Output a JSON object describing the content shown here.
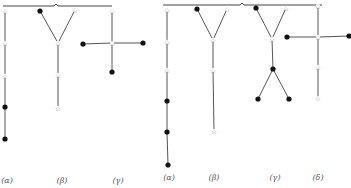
{
  "figure": {
    "groups": [
      {
        "id": "left",
        "bracket": {
          "x1": 3,
          "x2": 112,
          "y": 5,
          "mid": 56
        },
        "trees": [
          {
            "label": "(α)",
            "label_x": 7,
            "label_y": 183,
            "nodes": [
              {
                "x": 5,
                "y": 11,
                "type": "star"
              },
              {
                "x": 5,
                "y": 43,
                "type": "star"
              },
              {
                "x": 5,
                "y": 76,
                "type": "star"
              },
              {
                "x": 5,
                "y": 107,
                "type": "dot"
              },
              {
                "x": 5,
                "y": 139,
                "type": "dot"
              }
            ],
            "edges": [
              [
                0,
                1
              ],
              [
                1,
                2
              ],
              [
                2,
                3
              ],
              [
                3,
                4
              ]
            ]
          },
          {
            "label": "(β)",
            "label_x": 62,
            "label_y": 183,
            "nodes": [
              {
                "x": 40,
                "y": 11,
                "type": "dot"
              },
              {
                "x": 75,
                "y": 10,
                "type": "star"
              },
              {
                "x": 58,
                "y": 43,
                "type": "star"
              },
              {
                "x": 58,
                "y": 75,
                "type": "star"
              },
              {
                "x": 58,
                "y": 108,
                "type": "star"
              }
            ],
            "edges": [
              [
                0,
                2
              ],
              [
                1,
                2
              ],
              [
                2,
                3
              ],
              [
                3,
                4
              ]
            ]
          },
          {
            "label": "(γ)",
            "label_x": 118,
            "label_y": 183,
            "nodes": [
              {
                "x": 112,
                "y": 11,
                "type": "star"
              },
              {
                "x": 112,
                "y": 43,
                "type": "star"
              },
              {
                "x": 83,
                "y": 44,
                "type": "dot"
              },
              {
                "x": 143,
                "y": 43,
                "type": "dot"
              },
              {
                "x": 112,
                "y": 72,
                "type": "dot"
              }
            ],
            "edges": [
              [
                0,
                1
              ],
              [
                2,
                1
              ],
              [
                1,
                3
              ],
              [
                1,
                4
              ]
            ]
          }
        ]
      },
      {
        "id": "right",
        "bracket": {
          "x1": 163,
          "x2": 322,
          "y": 4,
          "mid": 242
        },
        "trees": [
          {
            "label": "(α)",
            "label_x": 169,
            "label_y": 180,
            "nodes": [
              {
                "x": 167,
                "y": 10,
                "type": "star"
              },
              {
                "x": 167,
                "y": 42,
                "type": "star"
              },
              {
                "x": 167,
                "y": 70,
                "type": "star"
              },
              {
                "x": 167,
                "y": 101,
                "type": "dot"
              },
              {
                "x": 167,
                "y": 132,
                "type": "dot"
              },
              {
                "x": 168,
                "y": 165,
                "type": "dot"
              }
            ],
            "edges": [
              [
                0,
                1
              ],
              [
                1,
                2
              ],
              [
                2,
                3
              ],
              [
                3,
                4
              ],
              [
                4,
                5
              ]
            ]
          },
          {
            "label": "(β)",
            "label_x": 214,
            "label_y": 180,
            "nodes": [
              {
                "x": 197,
                "y": 9,
                "type": "dot"
              },
              {
                "x": 227,
                "y": 9,
                "type": "star"
              },
              {
                "x": 213,
                "y": 40,
                "type": "star"
              },
              {
                "x": 213,
                "y": 70,
                "type": "star"
              },
              {
                "x": 214,
                "y": 131,
                "type": "star"
              }
            ],
            "edges": [
              [
                0,
                2
              ],
              [
                1,
                2
              ],
              [
                2,
                3
              ],
              [
                3,
                4
              ]
            ]
          },
          {
            "label": "(γ)",
            "label_x": 275,
            "label_y": 180,
            "nodes": [
              {
                "x": 256,
                "y": 8,
                "type": "dot"
              },
              {
                "x": 286,
                "y": 8,
                "type": "star"
              },
              {
                "x": 272,
                "y": 39,
                "type": "star"
              },
              {
                "x": 273,
                "y": 69,
                "type": "dot"
              },
              {
                "x": 258,
                "y": 99,
                "type": "dot"
              },
              {
                "x": 289,
                "y": 99,
                "type": "dot"
              }
            ],
            "edges": [
              [
                0,
                2
              ],
              [
                1,
                2
              ],
              [
                2,
                3
              ],
              [
                3,
                4
              ],
              [
                3,
                5
              ]
            ]
          },
          {
            "label": "(δ)",
            "label_x": 318,
            "label_y": 180,
            "nodes": [
              {
                "x": 318,
                "y": 6,
                "type": "star"
              },
              {
                "x": 318,
                "y": 37,
                "type": "star"
              },
              {
                "x": 287,
                "y": 37,
                "type": "dot"
              },
              {
                "x": 349,
                "y": 36,
                "type": "dot"
              },
              {
                "x": 318,
                "y": 67,
                "type": "star"
              },
              {
                "x": 318,
                "y": 98,
                "type": "star"
              }
            ],
            "edges": [
              [
                0,
                1
              ],
              [
                2,
                1
              ],
              [
                1,
                3
              ],
              [
                1,
                4
              ],
              [
                4,
                5
              ]
            ]
          }
        ]
      }
    ]
  }
}
